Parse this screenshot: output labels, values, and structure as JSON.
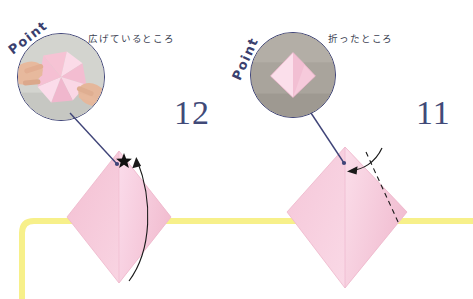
{
  "page": {
    "background_color": "#ffffff",
    "width": 473,
    "height": 299
  },
  "colors": {
    "step_number": "#414a78",
    "caption_text": "#3b3f52",
    "point_text": "#3a3f6e",
    "bubble_border": "#3f4478",
    "paper_pink": "#f7c8d8",
    "paper_pink_light": "#fbdde8",
    "paper_pink_shadow": "#eeb6ca",
    "guide_yellow": "#f7f08a",
    "fold_line": "#1a1a1a",
    "arrow": "#111111",
    "pointer_line": "#3f4478",
    "photo_bg_left": "#cfd0cc",
    "photo_bg_right": "#a7a29b"
  },
  "steps": [
    {
      "id": "step-12",
      "number": "12",
      "number_position": {
        "x": 174,
        "y": 96
      },
      "caption": "広げているところ",
      "caption_position": {
        "x": 88,
        "y": 31
      },
      "point_label": "Point",
      "point_rotation_deg": -38,
      "photo": {
        "name": "photo-hands-spreading-pinwheel",
        "description": "hands spreading a pink pinwheel shaped origami",
        "shape": "circle",
        "center": {
          "x": 61,
          "y": 77
        },
        "radius": 44
      },
      "diagram": {
        "name": "diagram-diamond-with-star",
        "shape": "diamond",
        "marker": "star",
        "arrow": "curved-up-arrow"
      }
    },
    {
      "id": "step-11",
      "number": "11",
      "number_position": {
        "x": 416,
        "y": 96
      },
      "caption": "折ったところ",
      "caption_position": {
        "x": 328,
        "y": 31
      },
      "point_label": "Point",
      "point_rotation_deg": -66,
      "photo": {
        "name": "photo-folded-pink-diamond",
        "description": "pink folded diamond origami on gray background",
        "shape": "circle",
        "center": {
          "x": 293,
          "y": 75
        },
        "radius": 43
      },
      "diagram": {
        "name": "diagram-kite-with-dashed-fold",
        "shape": "kite",
        "fold_line": "dashed",
        "arrow": "curved-down-arrow"
      }
    }
  ],
  "guide_line": {
    "name": "yellow-guide-line",
    "color": "#f7f08a",
    "description": "yellow rounded guide path running horizontally across the page and turning down at the left"
  }
}
